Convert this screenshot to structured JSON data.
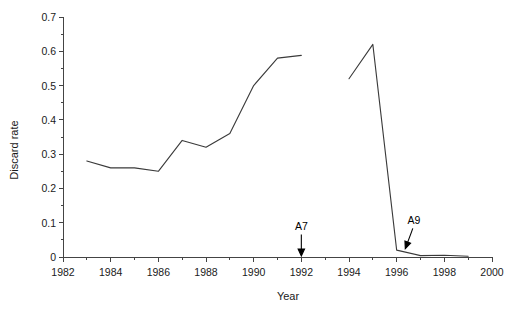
{
  "chart_data": {
    "type": "line",
    "title": "",
    "xlabel": "Year",
    "ylabel": "Discard rate",
    "xlim": [
      1982,
      2000
    ],
    "ylim": [
      0,
      0.7
    ],
    "grid": false,
    "legend": "none",
    "x_ticks": [
      1982,
      1984,
      1986,
      1988,
      1990,
      1992,
      1994,
      1996,
      1998,
      2000
    ],
    "x_tick_labels": [
      "1982",
      "1984",
      "1986",
      "1988",
      "1990",
      "1992",
      "1994",
      "1996",
      "1998",
      "2000"
    ],
    "x_minor_ticks": [
      1983,
      1985,
      1987,
      1989,
      1991,
      1993,
      1995,
      1997,
      1999
    ],
    "y_ticks": [
      0,
      0.1,
      0.2,
      0.3,
      0.4,
      0.5,
      0.6,
      0.7
    ],
    "y_tick_labels": [
      "0",
      "0.1",
      "0.2",
      "0.3",
      "0.4",
      "0.5",
      "0.6",
      "0.7"
    ],
    "y_minor_ticks": [
      0.05,
      0.15,
      0.25,
      0.35,
      0.45,
      0.55,
      0.65
    ],
    "series": [
      {
        "name": "discard-rate-segment-1",
        "x": [
          1983,
          1984,
          1985,
          1986,
          1987,
          1988,
          1989,
          1990,
          1991,
          1992
        ],
        "values": [
          0.28,
          0.26,
          0.26,
          0.25,
          0.34,
          0.32,
          0.36,
          0.5,
          0.58,
          0.588
        ]
      },
      {
        "name": "discard-rate-segment-2",
        "x": [
          1994,
          1995,
          1996,
          1997,
          1998,
          1999
        ],
        "values": [
          0.52,
          0.62,
          0.02,
          0.004,
          0.005,
          0.002
        ]
      }
    ],
    "annotations": [
      {
        "label": "A7",
        "x": 1992,
        "y": 0,
        "arrow": "down",
        "label_offset_y": 0.08
      },
      {
        "label": "A9",
        "x": 1996.3,
        "y": 0.02,
        "arrow": "down-left",
        "label_offset_y": 0.075
      }
    ]
  },
  "colors": {
    "line": "#3a3a3a",
    "axis": "#444444",
    "text": "#1a1a1a",
    "annotation": "#000000",
    "background": "#ffffff"
  }
}
